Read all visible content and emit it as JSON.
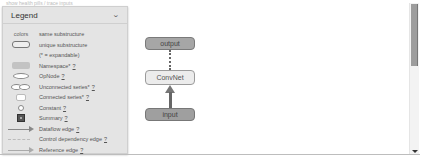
{
  "top_strip": {
    "text": "show health pills / trace inputs"
  },
  "legend": {
    "title": "Legend",
    "colors_label": "colors",
    "items": [
      {
        "icon": "colors-label",
        "label": "same substructure",
        "help": ""
      },
      {
        "icon": "unique-substructure-rect-icon",
        "label": "unique substructure",
        "help": ""
      },
      {
        "icon": "",
        "label": "(* = expandable)",
        "help": ""
      },
      {
        "icon": "namespace-rect-icon",
        "label": "Namespace*",
        "help": "?"
      },
      {
        "icon": "opnode-ellipse-icon",
        "label": "OpNode",
        "help": "?"
      },
      {
        "icon": "unconnected-series-icon",
        "label": "Unconnected series*",
        "help": "?"
      },
      {
        "icon": "connected-series-icon",
        "label": "Connected series*",
        "help": "?"
      },
      {
        "icon": "constant-circle-icon",
        "label": "Constant",
        "help": "?"
      },
      {
        "icon": "summary-icon",
        "label": "Summary",
        "help": "?"
      },
      {
        "icon": "dataflow-edge-icon",
        "label": "Dataflow edge",
        "help": "?"
      },
      {
        "icon": "control-dependency-edge-icon",
        "label": "Control dependency edge",
        "help": "?"
      },
      {
        "icon": "reference-edge-icon",
        "label": "Reference edge",
        "help": "?"
      }
    ]
  },
  "graph": {
    "nodes": [
      {
        "id": "output",
        "label": "output",
        "type": "namespace"
      },
      {
        "id": "convnet",
        "label": "ConvNet",
        "type": "unique-substructure"
      },
      {
        "id": "input",
        "label": "input",
        "type": "namespace"
      }
    ],
    "edges": [
      {
        "from": "input",
        "to": "convnet",
        "kind": "dataflow"
      },
      {
        "from": "convnet",
        "to": "output",
        "kind": "control-dependency"
      }
    ]
  },
  "colors": {
    "legend_bg": "#e4e4e4",
    "namespace_fill": "#a6a6a6",
    "unique_fill": "#ececec",
    "scroll_thumb": "#9d9d9d"
  }
}
